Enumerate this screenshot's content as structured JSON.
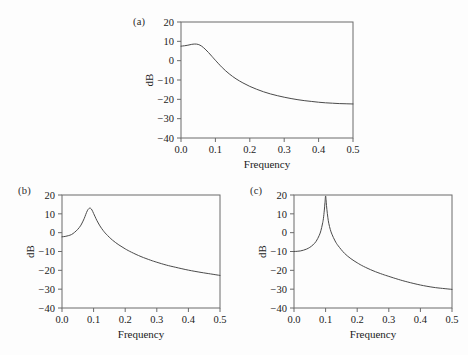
{
  "figure": {
    "background_color": "#fdfdfd",
    "line_color": "#4a4a4a",
    "axis_color": "#6b6b6b"
  },
  "panels": [
    {
      "tag": "(a)",
      "xlabel": "Frequency",
      "ylabel": "dB"
    },
    {
      "tag": "(b)",
      "xlabel": "Frequency",
      "ylabel": "dB"
    },
    {
      "tag": "(c)",
      "xlabel": "Frequency",
      "ylabel": "dB"
    }
  ],
  "chart_data": [
    {
      "type": "line",
      "title": "(a)",
      "xlabel": "Frequency",
      "ylabel": "dB",
      "xlim": [
        0.0,
        0.5
      ],
      "ylim": [
        -40,
        20
      ],
      "xticks": [
        0.0,
        0.1,
        0.2,
        0.3,
        0.4,
        0.5
      ],
      "xtick_labels": [
        "0.0",
        "0.1",
        "0.2",
        "0.3",
        "0.4",
        "0.5"
      ],
      "yticks": [
        -40,
        -30,
        -20,
        -10,
        0,
        10,
        20
      ],
      "ytick_labels": [
        "-40",
        "-30",
        "-20",
        "-10",
        "0",
        "10",
        "20"
      ],
      "grid": false,
      "legend": null,
      "x": [
        0.0,
        0.01,
        0.02,
        0.03,
        0.04,
        0.05,
        0.06,
        0.07,
        0.08,
        0.09,
        0.1,
        0.12,
        0.14,
        0.16,
        0.18,
        0.2,
        0.22,
        0.24,
        0.26,
        0.28,
        0.3,
        0.32,
        0.34,
        0.36,
        0.38,
        0.4,
        0.42,
        0.44,
        0.46,
        0.48,
        0.5
      ],
      "y": [
        7.5,
        7.7,
        8.0,
        8.4,
        8.6,
        8.4,
        7.5,
        6.0,
        4.2,
        2.2,
        0.2,
        -3.6,
        -6.8,
        -9.4,
        -11.5,
        -13.3,
        -14.8,
        -16.1,
        -17.2,
        -18.1,
        -18.9,
        -19.6,
        -20.2,
        -20.7,
        -21.1,
        -21.5,
        -21.8,
        -22.0,
        -22.2,
        -22.3,
        -22.4
      ]
    },
    {
      "type": "line",
      "title": "(b)",
      "xlabel": "Frequency",
      "ylabel": "dB",
      "xlim": [
        0.0,
        0.5
      ],
      "ylim": [
        -40,
        20
      ],
      "xticks": [
        0.0,
        0.1,
        0.2,
        0.3,
        0.4,
        0.5
      ],
      "xtick_labels": [
        "0.0",
        "0.1",
        "0.2",
        "0.3",
        "0.4",
        "0.5"
      ],
      "yticks": [
        -40,
        -30,
        -20,
        -10,
        0,
        10,
        20
      ],
      "ytick_labels": [
        "-40",
        "-30",
        "-20",
        "-10",
        "0",
        "10",
        "20"
      ],
      "grid": false,
      "legend": null,
      "peak": {
        "x": 0.09,
        "y": 13.0
      },
      "x": [
        0.0,
        0.01,
        0.02,
        0.03,
        0.04,
        0.05,
        0.06,
        0.07,
        0.075,
        0.08,
        0.085,
        0.09,
        0.095,
        0.1,
        0.105,
        0.11,
        0.12,
        0.13,
        0.14,
        0.16,
        0.18,
        0.2,
        0.22,
        0.25,
        0.28,
        0.3,
        0.33,
        0.36,
        0.4,
        0.44,
        0.47,
        0.5
      ],
      "y": [
        -2.2,
        -2.0,
        -1.6,
        -1.0,
        0.2,
        1.8,
        4.0,
        7.4,
        9.6,
        11.6,
        12.8,
        13.0,
        12.0,
        10.2,
        8.4,
        6.6,
        3.6,
        1.2,
        -0.8,
        -4.0,
        -6.5,
        -8.6,
        -10.4,
        -12.7,
        -14.6,
        -15.7,
        -17.2,
        -18.4,
        -19.9,
        -21.1,
        -21.9,
        -22.7
      ]
    },
    {
      "type": "line",
      "title": "(c)",
      "xlabel": "Frequency",
      "ylabel": "dB",
      "xlim": [
        0.0,
        0.5
      ],
      "ylim": [
        -40,
        20
      ],
      "xticks": [
        0.0,
        0.1,
        0.2,
        0.3,
        0.4,
        0.5
      ],
      "xtick_labels": [
        "0.0",
        "0.1",
        "0.2",
        "0.3",
        "0.4",
        "0.5"
      ],
      "yticks": [
        -40,
        -30,
        -20,
        -10,
        0,
        10,
        20
      ],
      "ytick_labels": [
        "-40",
        "-30",
        "-20",
        "-10",
        "0",
        "10",
        "20"
      ],
      "grid": false,
      "legend": null,
      "peak": {
        "x": 0.1,
        "y": 19.5
      },
      "x": [
        0.0,
        0.01,
        0.02,
        0.03,
        0.04,
        0.05,
        0.06,
        0.07,
        0.08,
        0.085,
        0.09,
        0.093,
        0.096,
        0.098,
        0.1,
        0.102,
        0.104,
        0.107,
        0.11,
        0.115,
        0.12,
        0.13,
        0.14,
        0.16,
        0.18,
        0.2,
        0.22,
        0.25,
        0.28,
        0.3,
        0.33,
        0.36,
        0.4,
        0.44,
        0.47,
        0.5
      ],
      "y": [
        -10.0,
        -9.9,
        -9.7,
        -9.3,
        -8.7,
        -7.8,
        -6.5,
        -4.6,
        -1.4,
        1.0,
        4.6,
        7.4,
        12.0,
        16.0,
        19.5,
        16.2,
        12.4,
        8.2,
        5.0,
        1.6,
        -0.8,
        -4.4,
        -7.0,
        -11.0,
        -13.8,
        -16.0,
        -17.9,
        -20.2,
        -22.1,
        -23.2,
        -24.8,
        -26.2,
        -27.8,
        -29.0,
        -29.6,
        -30.1
      ]
    }
  ]
}
